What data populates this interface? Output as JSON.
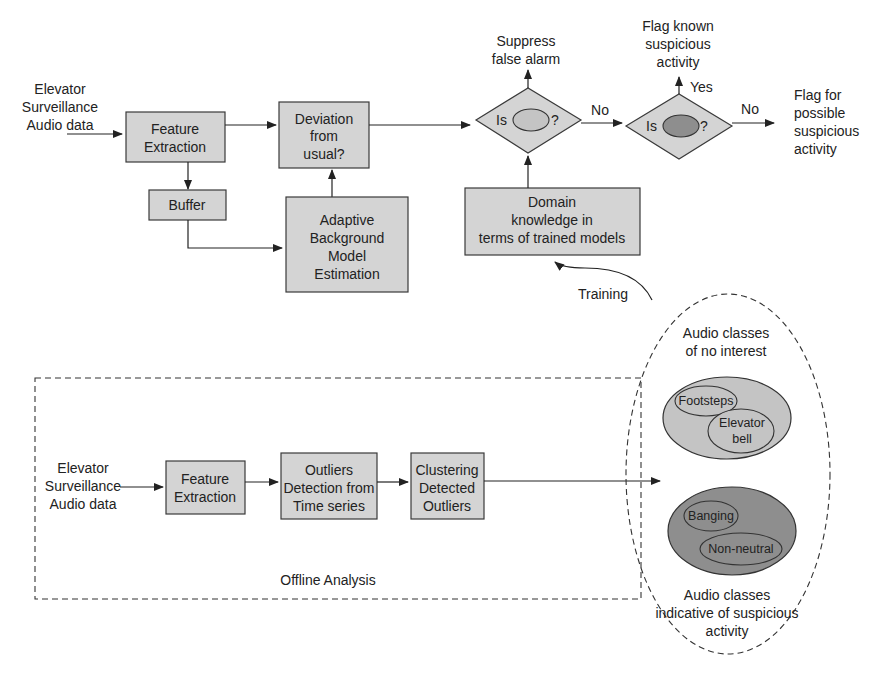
{
  "online": {
    "input_label": [
      "Elevator",
      "Surveillance",
      "Audio data"
    ],
    "feature_extraction": [
      "Feature",
      "Extraction"
    ],
    "buffer": "Buffer",
    "deviation": [
      "Deviation",
      "from",
      "usual?"
    ],
    "adaptive_model": [
      "Adaptive",
      "Background",
      "Model",
      "Estimation"
    ],
    "decision1": {
      "prefix": "Is",
      "suffix": "?"
    },
    "decision2": {
      "prefix": "Is",
      "suffix": "?"
    },
    "suppress": [
      "Suppress",
      "false alarm"
    ],
    "flag_known": [
      "Flag known",
      "suspicious",
      "activity"
    ],
    "yes_label": "Yes",
    "no_label_1": "No",
    "no_label_2": "No",
    "flag_possible": [
      "Flag for",
      "possible",
      "suspicious",
      "activity"
    ],
    "domain_knowledge": [
      "Domain",
      "knowledge in",
      "terms of trained models"
    ],
    "training_label": "Training"
  },
  "offline": {
    "title": "Offline Analysis",
    "input_label": [
      "Elevator",
      "Surveillance",
      "Audio data"
    ],
    "feature_extraction": [
      "Feature",
      "Extraction"
    ],
    "outliers": [
      "Outliers",
      "Detection from",
      "Time series"
    ],
    "clustering": [
      "Clustering",
      "Detected",
      "Outliers"
    ]
  },
  "classes": {
    "no_interest_label": [
      "Audio classes",
      "of no interest"
    ],
    "no_interest_items": [
      "Footsteps",
      "Elevator",
      "bell"
    ],
    "suspicious_label": [
      "Audio classes",
      "indicative of suspicious",
      "activity"
    ],
    "suspicious_items": [
      "Banging",
      "Non-neutral"
    ],
    "colors": {
      "light": "#c4c4c4",
      "dark": "#8e8e8e",
      "box": "#d4d4d4"
    }
  }
}
